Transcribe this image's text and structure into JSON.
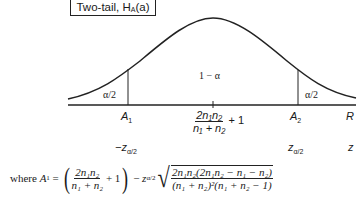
{
  "title": {
    "text": "Two-tail, H",
    "subscript": "A",
    "suffix": "(a)"
  },
  "diagram": {
    "center_region_label": "1 − α",
    "left_tail_label": "α/2",
    "right_tail_label": "α/2",
    "axis_R": {
      "left_critical": "A",
      "left_critical_sub": "1",
      "center_num": "2n₁n₂",
      "center_den": "n₁ + n₂",
      "center_suffix": "+ 1",
      "right_critical": "A",
      "right_critical_sub": "2",
      "axis_name": "R"
    },
    "axis_z": {
      "left": "−z",
      "left_sub": "α/2",
      "right": "z",
      "right_sub": "α/2",
      "axis_name": "z"
    }
  },
  "formula": {
    "prefix": "where ",
    "lhs": "A",
    "lhs_sub": "1",
    "equals": " = ",
    "mean_num": "2n₁n₂",
    "mean_den": "n₁ + n₂",
    "mean_plus": " + 1",
    "minus": " − ",
    "z": "z",
    "z_sub": "α/2",
    "sd_num": "2n₁n₂(2n₁n₂ − n₁ − n₂)",
    "sd_den": "(n₁ + n₂)²(n₁ + n₂ − 1)"
  }
}
